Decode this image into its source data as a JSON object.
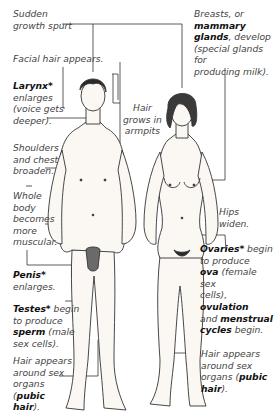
{
  "diagram": {
    "figures": [
      "male-figure",
      "female-figure"
    ],
    "labels": {
      "growth_spurt": {
        "l1": "Sudden",
        "l2": "growth spurt"
      },
      "facial_hair": "Facial hair appears.",
      "larynx": {
        "bold": "Larynx*",
        "l2": "enlarges",
        "l3": "(voice gets",
        "l4": "deeper)."
      },
      "armpit_hair": {
        "l1": "Hair",
        "l2": "grows in",
        "l3": "armpits"
      },
      "shoulders": {
        "l1": "Shoulders",
        "l2": "and chest",
        "l3": "broaden."
      },
      "muscular": {
        "l1": "Whole",
        "l2": "body",
        "l3": "becomes",
        "l4": "more",
        "l5": "muscular."
      },
      "penis": {
        "bold": "Penis*",
        "l2": "enlarges."
      },
      "testes": {
        "bold": "Testes*",
        "l1_rest": " begin",
        "l2": "to produce",
        "bold2": "sperm",
        "l3_rest": " (male",
        "l4": "sex cells)."
      },
      "male_pubic": {
        "l1": "Hair appears",
        "l2": "around sex",
        "l3": "organs",
        "l4_pre": "(",
        "bold1": "pubic",
        "bold2": "hair",
        "l5_post": ")."
      },
      "breasts": {
        "l1": "Breasts, or",
        "bold1": "mammary",
        "bold2": "glands",
        "l3_rest": ", develop",
        "l4": "(special glands for",
        "l5": "producing milk)."
      },
      "hips": {
        "l1": "Hips",
        "l2": "widen."
      },
      "ovaries": {
        "bold1": "Ovaries*",
        "l1_rest": " begin",
        "l2": "to produce",
        "bold2": "ova",
        "l3_rest": " (female sex",
        "l4_pre": "cells), ",
        "bold3": "ovulation",
        "l5_pre": "and ",
        "bold4": "menstrual",
        "bold5": "cycles",
        "l6_rest": " begin."
      },
      "female_pubic": {
        "l1": "Hair appears",
        "l2": "around sex",
        "l3_pre": "organs (",
        "bold1": "pubic",
        "bold2": "hair",
        "l4_post": ")."
      }
    },
    "colors": {
      "line": "#333333",
      "skin": "#fbf8f4",
      "hair": "#2a2a2a",
      "text": "#444444"
    }
  }
}
